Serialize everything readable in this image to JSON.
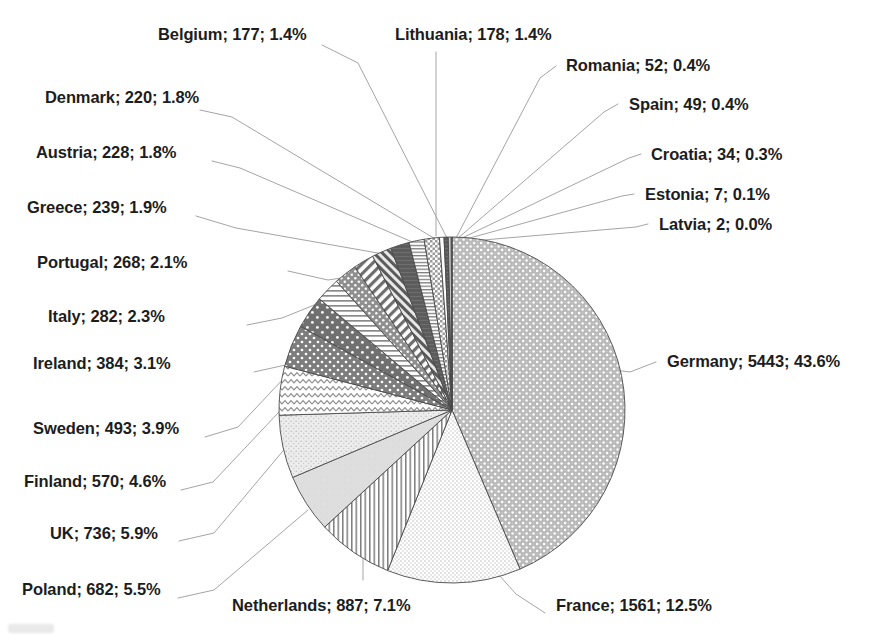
{
  "chart_data": {
    "type": "pie",
    "title": "",
    "subtitle": "",
    "xlabel": "",
    "ylabel": "",
    "legend_position": "none",
    "grid": false,
    "label_format": "name; value; percent",
    "start_angle_deg": 0,
    "direction": "clockwise",
    "total": 12494,
    "categories": [
      "Germany",
      "France",
      "Netherlands",
      "Poland",
      "UK",
      "Finland",
      "Sweden",
      "Ireland",
      "Italy",
      "Portugal",
      "Greece",
      "Austria",
      "Denmark",
      "Belgium",
      "Lithuania",
      "Romania",
      "Spain",
      "Croatia",
      "Estonia",
      "Latvia"
    ],
    "values": [
      5443,
      1561,
      887,
      682,
      736,
      570,
      493,
      384,
      282,
      268,
      239,
      228,
      220,
      177,
      178,
      52,
      49,
      34,
      7,
      2
    ],
    "percents": [
      43.6,
      12.5,
      7.1,
      5.5,
      5.9,
      4.6,
      3.9,
      3.1,
      2.3,
      2.1,
      1.9,
      1.8,
      1.8,
      1.4,
      1.4,
      0.4,
      0.4,
      0.3,
      0.1,
      0.0
    ],
    "slices": [
      {
        "name": "Germany",
        "value": 5443,
        "percent": 43.6,
        "label": "Germany; 5443; 43.6%",
        "pattern": "dense-dot-gray"
      },
      {
        "name": "France",
        "value": 1561,
        "percent": 12.5,
        "label": "France; 1561; 12.5%",
        "pattern": "fine-dot-light"
      },
      {
        "name": "Netherlands",
        "value": 887,
        "percent": 7.1,
        "label": "Netherlands; 887; 7.1%",
        "pattern": "vertical-lines"
      },
      {
        "name": "Poland",
        "value": 682,
        "percent": 5.5,
        "label": "Poland; 682; 5.5%",
        "pattern": "solid-light-gray"
      },
      {
        "name": "UK",
        "value": 736,
        "percent": 5.9,
        "label": "UK; 736; 5.9%",
        "pattern": "speckle-light"
      },
      {
        "name": "Finland",
        "value": 570,
        "percent": 4.6,
        "label": "Finland; 570; 4.6%",
        "pattern": "zigzag-wave"
      },
      {
        "name": "Sweden",
        "value": 493,
        "percent": 3.9,
        "label": "Sweden; 493; 3.9%",
        "pattern": "dark-gray-dots"
      },
      {
        "name": "Ireland",
        "value": 384,
        "percent": 3.1,
        "label": "Ireland; 384; 3.1%",
        "pattern": "dark-gray-sparse-dots"
      },
      {
        "name": "Italy",
        "value": 282,
        "percent": 2.3,
        "label": "Italy; 282; 2.3%",
        "pattern": "horizontal-lines"
      },
      {
        "name": "Portugal",
        "value": 268,
        "percent": 2.1,
        "label": "Portugal; 268; 2.1%",
        "pattern": "mid-gray-dots"
      },
      {
        "name": "Greece",
        "value": 239,
        "percent": 1.9,
        "label": "Greece; 239; 1.9%",
        "pattern": "diagonal-stripes"
      },
      {
        "name": "Austria",
        "value": 228,
        "percent": 1.8,
        "label": "Austria; 228; 1.8%",
        "pattern": "diagonal-hatch-dark"
      },
      {
        "name": "Denmark",
        "value": 220,
        "percent": 1.8,
        "label": "Denmark; 220; 1.8%",
        "pattern": "dark-solid"
      },
      {
        "name": "Belgium",
        "value": 177,
        "percent": 1.4,
        "label": "Belgium; 177; 1.4%",
        "pattern": "horizontal-thin-lines"
      },
      {
        "name": "Lithuania",
        "value": 178,
        "percent": 1.4,
        "label": "Lithuania; 178; 1.4%",
        "pattern": "checker-dot"
      },
      {
        "name": "Romania",
        "value": 52,
        "percent": 0.4,
        "label": "Romania; 52; 0.4%",
        "pattern": "white"
      },
      {
        "name": "Spain",
        "value": 49,
        "percent": 0.4,
        "label": "Spain; 49; 0.4%",
        "pattern": "dark-solid"
      },
      {
        "name": "Croatia",
        "value": 34,
        "percent": 0.3,
        "label": "Croatia; 34; 0.3%",
        "pattern": "light-gray"
      },
      {
        "name": "Estonia",
        "value": 7,
        "percent": 0.1,
        "label": "Estonia; 7; 0.1%",
        "pattern": "white"
      },
      {
        "name": "Latvia",
        "value": 2,
        "percent": 0.0,
        "label": "Latvia; 2; 0.0%",
        "pattern": "white"
      }
    ]
  },
  "labels": {
    "belgium": "Belgium; 177; 1.4%",
    "lithuania": "Lithuania; 178; 1.4%",
    "romania": "Romania; 52; 0.4%",
    "spain": "Spain; 49; 0.4%",
    "croatia": "Croatia; 34; 0.3%",
    "estonia": "Estonia; 7; 0.1%",
    "latvia": "Latvia; 2; 0.0%",
    "denmark": "Denmark; 220; 1.8%",
    "austria": "Austria; 228; 1.8%",
    "greece": "Greece; 239; 1.9%",
    "portugal": "Portugal; 268; 2.1%",
    "italy": "Italy; 282; 2.3%",
    "ireland": "Ireland; 384; 3.1%",
    "sweden": "Sweden; 493; 3.9%",
    "finland": "Finland; 570; 4.6%",
    "uk": "UK; 736; 5.9%",
    "poland": "Poland; 682; 5.5%",
    "netherlands": "Netherlands; 887; 7.1%",
    "france": "France; 1561; 12.5%",
    "germany": "Germany; 5443; 43.6%"
  },
  "colors": {
    "text": "#1d1d1d",
    "background": "#ffffff",
    "leader_line": "#9a9a9a",
    "slice_outline": "#4a4a4a"
  }
}
